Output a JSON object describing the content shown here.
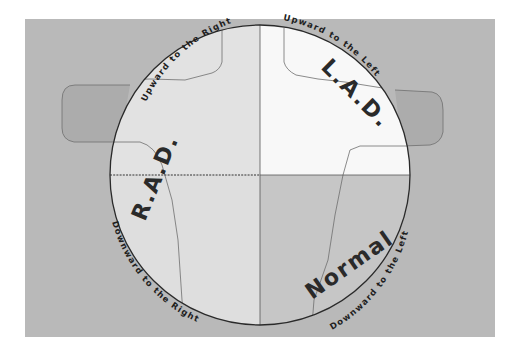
{
  "diagram": {
    "title": "",
    "quadrants": {
      "top_left": {
        "label": "R.A.D.",
        "arc_label": "Upward to the Right",
        "fill": "#e2e2e2"
      },
      "top_right": {
        "label": "L.A.D.",
        "arc_label": "Upward to the Left",
        "fill": "#f8f8f8"
      },
      "bottom_left": {
        "label": "",
        "arc_label": "Downward to the Right",
        "fill": "#dedede"
      },
      "bottom_right": {
        "label": "Normal",
        "arc_label": "Downward to the Left",
        "fill": "#c6c6c6"
      }
    },
    "colors": {
      "background": "#b9b9b9",
      "page": "#ffffff",
      "circle_stroke": "#2a2a2a",
      "outline_stroke": "#6e6e6e",
      "text": "#222222"
    }
  }
}
